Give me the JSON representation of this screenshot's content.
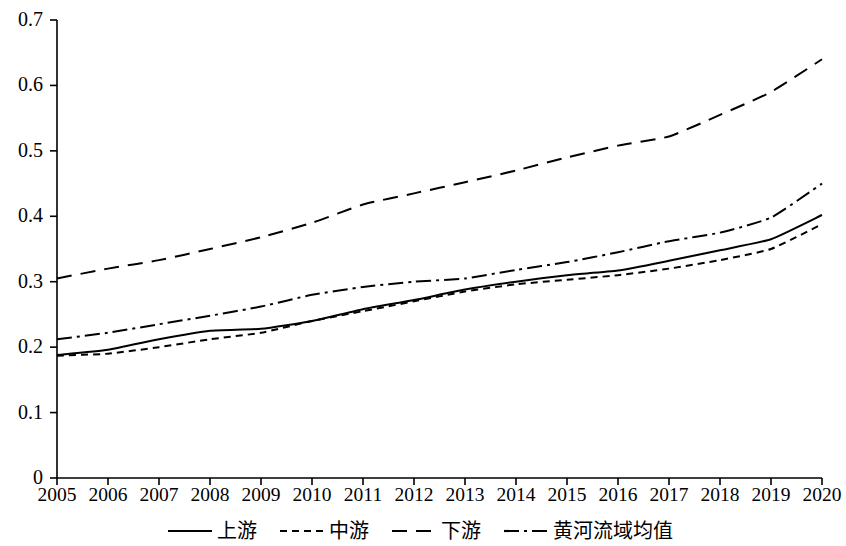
{
  "chart_data": {
    "type": "line",
    "title": "",
    "subtitle": "",
    "xlabel": "",
    "ylabel": "",
    "x": [
      2005,
      2006,
      2007,
      2008,
      2009,
      2010,
      2011,
      2012,
      2013,
      2014,
      2015,
      2016,
      2017,
      2018,
      2019,
      2020
    ],
    "categories": [
      "2005",
      "2006",
      "2007",
      "2008",
      "2009",
      "2010",
      "2011",
      "2012",
      "2013",
      "2014",
      "2015",
      "2016",
      "2017",
      "2018",
      "2019",
      "2020"
    ],
    "xlim": [
      2005,
      2020
    ],
    "ylim": [
      0,
      0.7
    ],
    "y_ticks": [
      0,
      0.1,
      0.2,
      0.3,
      0.4,
      0.5,
      0.6,
      0.7
    ],
    "y_tick_labels": [
      "0",
      "0.1",
      "0.2",
      "0.3",
      "0.4",
      "0.5",
      "0.6",
      "0.7"
    ],
    "grid": false,
    "legend_position": "bottom",
    "series": [
      {
        "name": "上游",
        "style": "solid",
        "color": "#000000",
        "values": [
          0.188,
          0.196,
          0.212,
          0.225,
          0.228,
          0.24,
          0.258,
          0.272,
          0.288,
          0.3,
          0.31,
          0.317,
          0.332,
          0.348,
          0.365,
          0.402
        ]
      },
      {
        "name": "中游",
        "style": "dotted",
        "color": "#000000",
        "values": [
          0.187,
          0.19,
          0.2,
          0.212,
          0.222,
          0.24,
          0.255,
          0.27,
          0.285,
          0.296,
          0.303,
          0.31,
          0.32,
          0.333,
          0.35,
          0.388
        ]
      },
      {
        "name": "下游",
        "style": "dashed",
        "color": "#000000",
        "values": [
          0.305,
          0.32,
          0.333,
          0.35,
          0.368,
          0.39,
          0.418,
          0.435,
          0.452,
          0.47,
          0.49,
          0.508,
          0.522,
          0.555,
          0.59,
          0.64
        ]
      },
      {
        "name": "黄河流域均值",
        "style": "dashdot",
        "color": "#000000",
        "values": [
          0.212,
          0.222,
          0.235,
          0.248,
          0.262,
          0.28,
          0.292,
          0.3,
          0.305,
          0.318,
          0.33,
          0.345,
          0.362,
          0.375,
          0.398,
          0.45
        ]
      }
    ]
  },
  "legend": {
    "items": [
      {
        "label": "上游",
        "style": "solid"
      },
      {
        "label": "中游",
        "style": "dotted"
      },
      {
        "label": "下游",
        "style": "dashed"
      },
      {
        "label": "黄河流域均值",
        "style": "dashdot"
      }
    ]
  }
}
